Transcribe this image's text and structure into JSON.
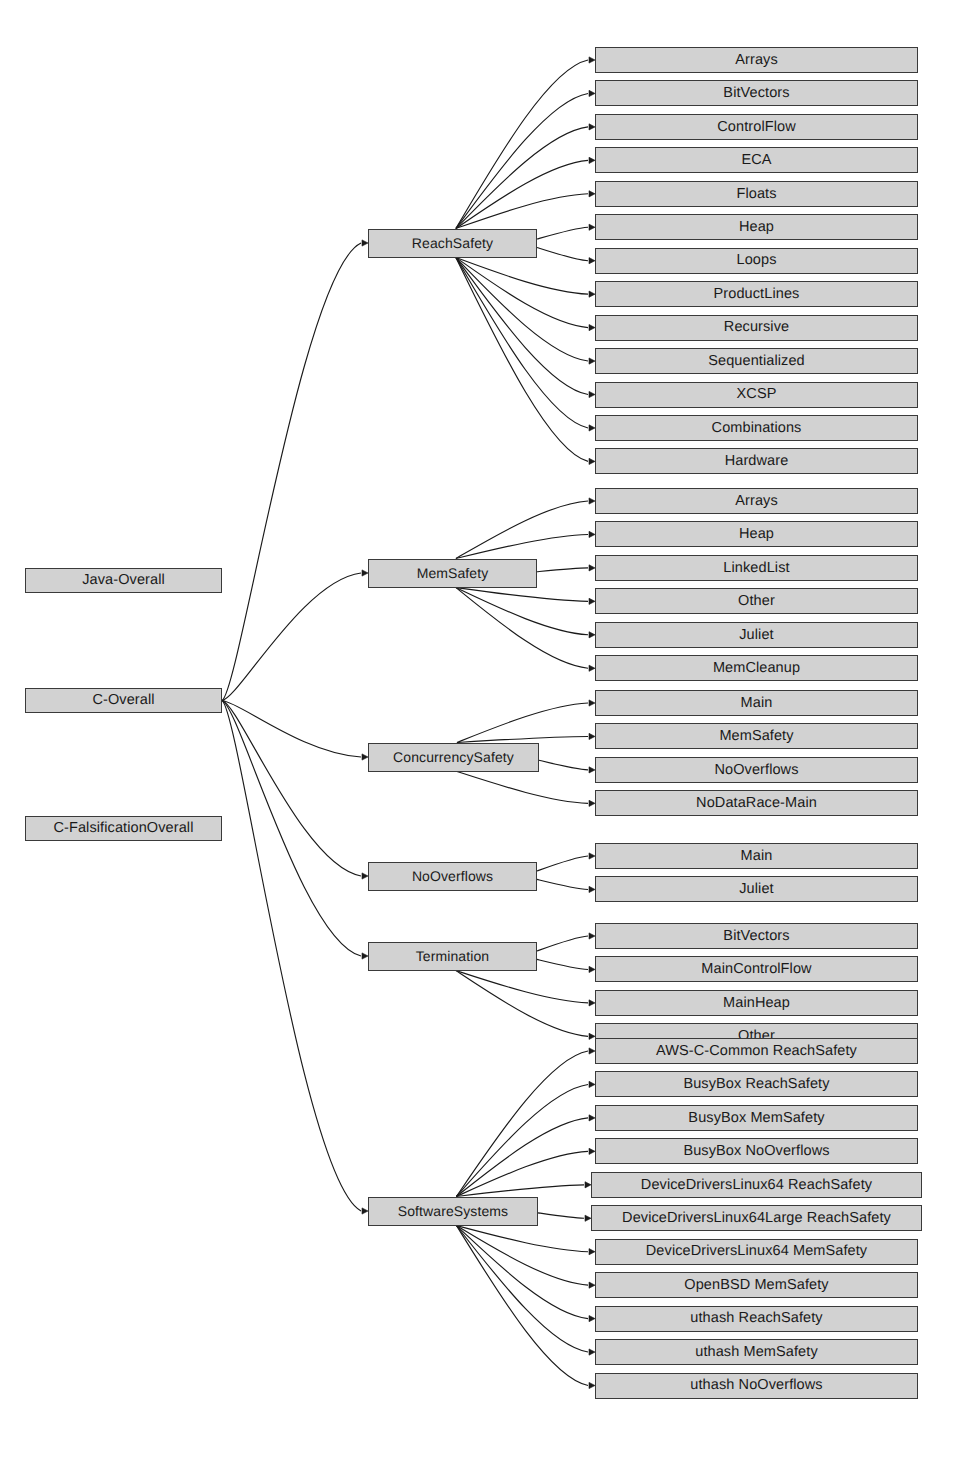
{
  "page_header": {
    "left": "",
    "middle": "",
    "right": ""
  },
  "diagram": {
    "type": "tree",
    "colors": {
      "node_fill": "#d2d2d2",
      "node_border": "#3a3a3a",
      "edge": "#1a1a1a",
      "background": "#ffffff"
    },
    "roots": [
      {
        "id": "java-overall",
        "label": "Java-Overall"
      },
      {
        "id": "c-overall",
        "label": "C-Overall"
      },
      {
        "id": "c-falsification-overall",
        "label": "C-FalsificationOverall"
      }
    ],
    "groups": [
      {
        "id": "reachsafety",
        "label": "ReachSafety",
        "parent": "c-overall",
        "children": [
          "Arrays",
          "BitVectors",
          "ControlFlow",
          "ECA",
          "Floats",
          "Heap",
          "Loops",
          "ProductLines",
          "Recursive",
          "Sequentialized",
          "XCSP",
          "Combinations",
          "Hardware"
        ]
      },
      {
        "id": "memsafety",
        "label": "MemSafety",
        "parent": "c-overall",
        "children": [
          "Arrays",
          "Heap",
          "LinkedList",
          "Other",
          "Juliet",
          "MemCleanup"
        ]
      },
      {
        "id": "concurrencysafety",
        "label": "ConcurrencySafety",
        "parent": "c-overall",
        "children": [
          "Main",
          "MemSafety",
          "NoOverflows",
          "NoDataRace-Main"
        ]
      },
      {
        "id": "nooverflows",
        "label": "NoOverflows",
        "parent": "c-overall",
        "children": [
          "Main",
          "Juliet"
        ]
      },
      {
        "id": "termination",
        "label": "Termination",
        "parent": "c-overall",
        "children": [
          "BitVectors",
          "MainControlFlow",
          "MainHeap",
          "Other"
        ]
      },
      {
        "id": "softwaresystems",
        "label": "SoftwareSystems",
        "parent": "c-overall",
        "children": [
          "AWS-C-Common ReachSafety",
          "BusyBox ReachSafety",
          "BusyBox MemSafety",
          "BusyBox NoOverflows",
          "DeviceDriversLinux64 ReachSafety",
          "DeviceDriversLinux64Large ReachSafety",
          "DeviceDriversLinux64 MemSafety",
          "OpenBSD MemSafety",
          "uthash ReachSafety",
          "uthash MemSafety",
          "uthash NoOverflows"
        ]
      }
    ]
  }
}
